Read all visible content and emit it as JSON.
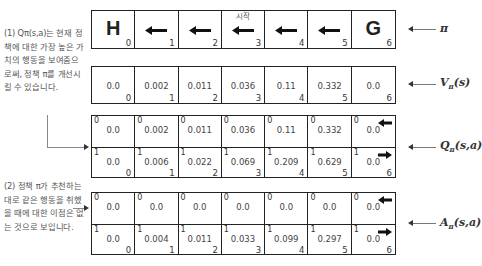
{
  "notes": {
    "note1": "(1) Qπ(s,a)는 현재 정책에 대한 가장 높은 가치의 행동을 보여줌으로써, 정책 π를 개선시킬 수 있습니다.",
    "note2": "(2) 정책 π가 추천하는 대로 같은 행동을 취했을 때에 대한 이점은 없는 것으로 보입니다."
  },
  "labels": {
    "pi": "π",
    "v": "V",
    "v_sub": "π",
    "v_arg": "(s)",
    "q": "Q",
    "q_sub": "π",
    "q_arg": "(s,a)",
    "a": "A",
    "a_sub": "π",
    "a_arg": "(s,a)"
  },
  "policy_row": {
    "start_label": "시작",
    "cells": [
      {
        "index": "0",
        "content": "H",
        "type": "terminal"
      },
      {
        "index": "1",
        "content": "left-arrow-icon",
        "type": "arrow"
      },
      {
        "index": "2",
        "content": "left-arrow-icon",
        "type": "arrow"
      },
      {
        "index": "3",
        "content": "left-arrow-icon",
        "type": "arrow"
      },
      {
        "index": "4",
        "content": "left-arrow-icon",
        "type": "arrow"
      },
      {
        "index": "5",
        "content": "left-arrow-icon",
        "type": "arrow"
      },
      {
        "index": "6",
        "content": "G",
        "type": "terminal"
      }
    ]
  },
  "v_row": {
    "values": [
      "0.0",
      "0.002",
      "0.011",
      "0.036",
      "0.11",
      "0.332",
      "0.0"
    ],
    "indices": [
      "0",
      "1",
      "2",
      "3",
      "4",
      "5",
      "6"
    ]
  },
  "q_row": {
    "action0_label": "0",
    "action1_label": "1",
    "action0": [
      "0.0",
      "0.002",
      "0.011",
      "0.036",
      "0.11",
      "0.332",
      "0.0"
    ],
    "action1": [
      "0.0",
      "0.006",
      "0.022",
      "0.069",
      "0.209",
      "0.629",
      "0.0"
    ],
    "indices": [
      "0",
      "1",
      "2",
      "3",
      "4",
      "5",
      "6"
    ]
  },
  "a_row": {
    "action0_label": "0",
    "action1_label": "1",
    "action0": [
      "0.0",
      "0.0",
      "0.0",
      "0.0",
      "0.0",
      "0.0",
      "0.0"
    ],
    "action1": [
      "0.0",
      "0.004",
      "0.011",
      "0.033",
      "0.099",
      "0.297",
      "0.0"
    ],
    "indices": [
      "0",
      "1",
      "2",
      "3",
      "4",
      "5",
      "6"
    ]
  }
}
